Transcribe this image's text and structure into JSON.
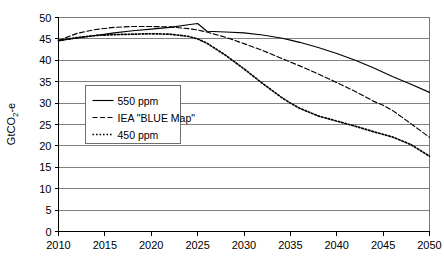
{
  "chart_data": {
    "type": "line",
    "title": "",
    "xlabel": "",
    "ylabel": "GtCO2-e",
    "ylabel_rich": {
      "prefix": "GtCO",
      "sub": "2",
      "suffix": "-e"
    },
    "xlim": [
      2010,
      2050
    ],
    "ylim": [
      0,
      50
    ],
    "xticks": [
      2010,
      2015,
      2020,
      2025,
      2030,
      2035,
      2040,
      2045,
      2050
    ],
    "yticks": [
      0,
      5,
      10,
      15,
      20,
      25,
      30,
      35,
      40,
      45,
      50
    ],
    "grid": "horizontal",
    "legend_position": "center-left",
    "x": [
      2010,
      2012,
      2014,
      2016,
      2018,
      2020,
      2022,
      2024,
      2025,
      2026,
      2028,
      2030,
      2032,
      2034,
      2035,
      2036,
      2038,
      2040,
      2042,
      2044,
      2045,
      2046,
      2048,
      2050
    ],
    "series": [
      {
        "name": "550 ppm",
        "style": "solid",
        "color": "#000000",
        "values": [
          44.6,
          45.2,
          45.8,
          46.4,
          46.9,
          47.3,
          47.7,
          48.3,
          48.6,
          46.8,
          46.6,
          46.4,
          45.9,
          45.2,
          44.7,
          44.2,
          43.0,
          41.6,
          40.0,
          38.2,
          37.2,
          36.2,
          34.4,
          32.5
        ]
      },
      {
        "name": "IEA \"BLUE Map\"",
        "style": "dashed",
        "color": "#000000",
        "values": [
          44.6,
          46.3,
          47.2,
          47.7,
          47.9,
          47.9,
          47.8,
          47.4,
          47.1,
          46.6,
          45.4,
          43.9,
          42.3,
          40.5,
          39.6,
          38.7,
          36.8,
          34.8,
          32.7,
          30.4,
          29.5,
          28.3,
          25.2,
          22.0
        ]
      },
      {
        "name": "450 ppm",
        "style": "dotted",
        "color": "#000000",
        "values": [
          44.6,
          45.3,
          45.8,
          46.0,
          46.1,
          46.2,
          46.1,
          45.6,
          45.0,
          44.0,
          41.2,
          38.0,
          34.6,
          31.4,
          30.0,
          28.8,
          27.0,
          25.8,
          24.6,
          23.3,
          22.7,
          22.1,
          20.3,
          17.6
        ]
      }
    ],
    "legend": [
      {
        "label": "550 ppm",
        "style": "solid"
      },
      {
        "label": "IEA \"BLUE Map\"",
        "style": "dashed"
      },
      {
        "label": "450 ppm",
        "style": "dotted"
      }
    ]
  }
}
